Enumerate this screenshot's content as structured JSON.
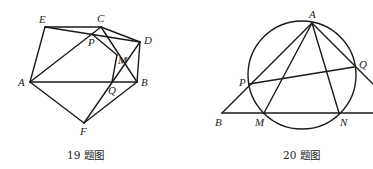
{
  "figures": [
    {
      "caption": "19 题图",
      "points": {
        "E": {
          "label": "E",
          "x": 45,
          "y": 27
        },
        "C": {
          "label": "C",
          "x": 101,
          "y": 27
        },
        "D": {
          "label": "D",
          "x": 140,
          "y": 42
        },
        "A": {
          "label": "A",
          "x": 30,
          "y": 82
        },
        "B": {
          "label": "B",
          "x": 137,
          "y": 82
        },
        "F": {
          "label": "F",
          "x": 84,
          "y": 123
        },
        "P": {
          "label": "P",
          "x": 92,
          "y": 34
        },
        "Q": {
          "label": "Q",
          "x": 112,
          "y": 82
        },
        "M": {
          "label": "M",
          "x": 117,
          "y": 55
        }
      },
      "segments": [
        "E-C",
        "E-A",
        "A-B",
        "A-F",
        "F-B",
        "A-C",
        "E-D",
        "C-D",
        "D-B",
        "C-B",
        "F-D",
        "P-M",
        "M-Q"
      ]
    },
    {
      "caption": "20 题图",
      "circle": {
        "cx": 302,
        "cy": 75,
        "r": 54
      },
      "points": {
        "A": {
          "label": "A",
          "x": 312,
          "y": 23
        },
        "P": {
          "label": "P",
          "x": 249,
          "y": 84
        },
        "Q": {
          "label": "Q",
          "x": 354,
          "y": 67
        },
        "B": {
          "label": "B",
          "x": 222,
          "y": 113
        },
        "M": {
          "label": "M",
          "x": 264,
          "y": 113
        },
        "N": {
          "label": "N",
          "x": 339,
          "y": 113
        }
      },
      "segments": [
        "B-A",
        "A-M",
        "A-N",
        "P-Q",
        "A-Q-extended",
        "B-baseline"
      ]
    }
  ]
}
